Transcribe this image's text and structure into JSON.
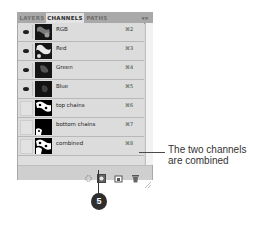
{
  "panel": {
    "tabs": [
      {
        "label": "LAYERS",
        "active": false
      },
      {
        "label": "CHANNELS",
        "active": true
      },
      {
        "label": "PATHS",
        "active": false
      }
    ],
    "menu_icon": "panel-menu-icon",
    "channels": [
      {
        "name": "RGB",
        "shortcut": "⌘2",
        "visible": true
      },
      {
        "name": "Red",
        "shortcut": "⌘3",
        "visible": true
      },
      {
        "name": "Green",
        "shortcut": "⌘4",
        "visible": true
      },
      {
        "name": "Blue",
        "shortcut": "⌘5",
        "visible": true
      },
      {
        "name": "top chains",
        "shortcut": "⌘6",
        "visible": false
      },
      {
        "name": "bottom chains",
        "shortcut": "⌘7",
        "visible": false
      },
      {
        "name": "combined",
        "shortcut": "⌘8",
        "visible": false
      }
    ],
    "toolbar": [
      "load-channel-as-selection-icon",
      "save-selection-as-channel-icon",
      "new-channel-icon",
      "delete-channel-icon"
    ]
  },
  "callout": {
    "text": "The two channels are combined"
  },
  "step": {
    "number": "5"
  },
  "colors": {
    "panel_bg": "#d6d6d6",
    "tab_active": "#e4e4e4",
    "tab_bar": "#a9a9a9",
    "badge": "#2e2e2e"
  }
}
